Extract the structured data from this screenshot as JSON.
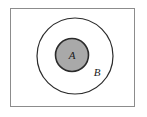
{
  "figure": {
    "type": "venn-set-diagram",
    "width": 147,
    "height": 117,
    "background_color": "#ffffff"
  },
  "frame": {
    "name": "universal-set-rectangle",
    "x": 10,
    "y": 8,
    "width": 125,
    "height": 99,
    "stroke_color": "#8c8c8c",
    "fill_color": "#ffffff",
    "stroke_width": 1
  },
  "sets": [
    {
      "id": "B",
      "label": "B",
      "shape": "circle",
      "cx": 75,
      "cy": 56,
      "r": 38,
      "fill_color": "#ffffff",
      "stroke_color": "#2b2b2b",
      "stroke_width": 1.2,
      "label_x": 97,
      "label_y": 76,
      "label_font_size": 11
    },
    {
      "id": "A",
      "label": "A",
      "shape": "circle",
      "cx": 72,
      "cy": 55,
      "r": 16.5,
      "fill_color": "#a9a9a9",
      "stroke_color": "#2b2b2b",
      "stroke_width": 1.6,
      "label_x": 72,
      "label_y": 59,
      "label_font_size": 11
    }
  ],
  "colors": {
    "shaded_set_fill": "#a9a9a9",
    "outline": "#2b2b2b",
    "frame_outline": "#8c8c8c",
    "label_text": "#1a1a1a"
  }
}
